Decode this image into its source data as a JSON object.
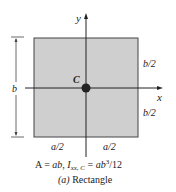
{
  "diagram": {
    "shape": "rectangle",
    "fill_color": "#cfcfcf",
    "stroke_color": "#333333",
    "axis_labels": {
      "x": "x",
      "y": "y"
    },
    "centroid_label": "C",
    "dimension_b": "b",
    "half_b_top": "b/2",
    "half_b_bottom": "b/2",
    "half_a_left": "a/2",
    "half_a_right": "a/2",
    "formula": {
      "area_lhs": "A",
      "area_rhs": "ab,",
      "inertia_symbol": "I",
      "inertia_subscript": "xx, C",
      "inertia_rhs_prefix": "ab",
      "inertia_exponent": "3",
      "inertia_rhs_suffix": "/12"
    },
    "caption_tag": "(a)",
    "caption_text": "Rectangle"
  }
}
